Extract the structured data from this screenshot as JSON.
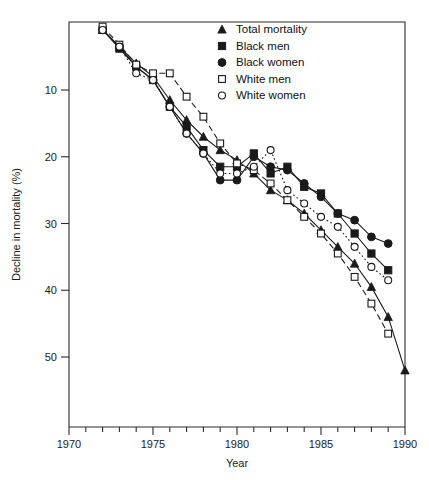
{
  "chart_data": {
    "type": "line",
    "title": "",
    "xlabel": "Year",
    "ylabel": "Decline in mortality (%)",
    "xlim": [
      1970,
      1990
    ],
    "ylim": [
      0,
      55
    ],
    "y_inverted": true,
    "grid": false,
    "legend_position": "top-right",
    "x_ticks_major": [
      1970,
      1975,
      1980,
      1985,
      1990
    ],
    "x_ticks_minor_step": 1,
    "y_ticks_major": [
      10,
      20,
      30,
      40,
      50
    ],
    "y_tick_labels": [
      "10",
      "20",
      "30",
      "40",
      "50"
    ],
    "x_tick_labels": [
      "1970",
      "1975",
      "1980",
      "1985",
      "1990"
    ],
    "series": [
      {
        "name": "Total mortality",
        "marker": "filled-triangle",
        "line": "solid",
        "x": [
          1972,
          1973,
          1974,
          1975,
          1976,
          1977,
          1978,
          1979,
          1980,
          1981,
          1982,
          1983,
          1984,
          1985,
          1986,
          1987,
          1988,
          1989,
          1990
        ],
        "values": [
          1.0,
          3.5,
          6.0,
          8.0,
          11.5,
          14.5,
          17.0,
          19.0,
          20.5,
          22.5,
          25.0,
          26.5,
          28.5,
          31.0,
          33.5,
          36.0,
          39.5,
          44.0,
          52.0
        ]
      },
      {
        "name": "Black men",
        "marker": "filled-square",
        "line": "solid",
        "x": [
          1972,
          1973,
          1974,
          1975,
          1976,
          1977,
          1978,
          1979,
          1980,
          1981,
          1982,
          1983,
          1984,
          1985,
          1986,
          1987,
          1988,
          1989
        ],
        "values": [
          1.0,
          3.8,
          6.5,
          8.5,
          12.5,
          15.5,
          19.0,
          21.5,
          21.5,
          19.5,
          22.5,
          21.5,
          24.5,
          25.5,
          28.5,
          31.5,
          34.5,
          37.0
        ]
      },
      {
        "name": "Black women",
        "marker": "filled-circle",
        "line": "solid",
        "x": [
          1972,
          1973,
          1974,
          1975,
          1976,
          1977,
          1978,
          1979,
          1980,
          1981,
          1982,
          1983,
          1984,
          1985,
          1986,
          1987,
          1988,
          1989
        ],
        "values": [
          1.0,
          3.5,
          6.5,
          8.5,
          12.5,
          16.5,
          19.5,
          23.5,
          23.5,
          20.0,
          21.5,
          22.0,
          24.0,
          26.0,
          28.5,
          29.5,
          32.0,
          33.0
        ]
      },
      {
        "name": "White men",
        "marker": "open-square",
        "line": "dashed",
        "x": [
          1972,
          1973,
          1974,
          1975,
          1976,
          1977,
          1978,
          1979,
          1980,
          1981,
          1982,
          1983,
          1984,
          1985,
          1986,
          1987,
          1988,
          1989
        ],
        "values": [
          0.5,
          3.2,
          6.2,
          7.5,
          7.5,
          11.0,
          14.0,
          18.0,
          21.0,
          22.0,
          24.0,
          26.5,
          29.0,
          31.5,
          34.5,
          38.0,
          42.0,
          46.5
        ]
      },
      {
        "name": "White women",
        "marker": "open-circle",
        "line": "dotted",
        "x": [
          1972,
          1973,
          1974,
          1975,
          1976,
          1977,
          1978,
          1979,
          1980,
          1981,
          1982,
          1983,
          1984,
          1985,
          1986,
          1987,
          1988,
          1989
        ],
        "values": [
          1.0,
          3.5,
          7.5,
          8.5,
          12.5,
          16.5,
          19.5,
          22.5,
          22.5,
          21.5,
          19.0,
          25.0,
          27.0,
          29.0,
          30.5,
          33.5,
          36.5,
          38.5
        ]
      }
    ],
    "legend_entries": [
      {
        "label": "Total mortality",
        "marker": "filled-triangle"
      },
      {
        "label": "Black men",
        "marker": "filled-square"
      },
      {
        "label": "Black women",
        "marker": "filled-circle"
      },
      {
        "label": "White men",
        "marker": "open-square"
      },
      {
        "label": "White women",
        "marker": "open-circle"
      }
    ],
    "colors": {
      "ink": "#1a1a1a",
      "background": "#ffffff"
    }
  }
}
